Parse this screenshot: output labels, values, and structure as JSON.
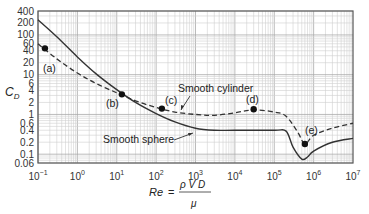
{
  "chart_data": {
    "type": "line",
    "title": "",
    "xlabel": "Re = ρVD/μ",
    "ylabel": "C_D",
    "xscale": "log",
    "yscale": "log",
    "xlim": [
      0.1,
      10000000
    ],
    "ylim": [
      0.06,
      400
    ],
    "grid": true,
    "x_ticks": [
      {
        "base": "10",
        "exp": "−1"
      },
      {
        "base": "10",
        "exp": "0"
      },
      {
        "base": "10",
        "exp": "1"
      },
      {
        "base": "10",
        "exp": "2"
      },
      {
        "base": "10",
        "exp": "3"
      },
      {
        "base": "10",
        "exp": "4"
      },
      {
        "base": "10",
        "exp": "5"
      },
      {
        "base": "10",
        "exp": "6"
      },
      {
        "base": "10",
        "exp": "7"
      }
    ],
    "y_ticks": [
      "400",
      "200",
      "100",
      "60",
      "40",
      "20",
      "10",
      "6",
      "4",
      "2",
      "1",
      "0.6",
      "0.4",
      "0.2",
      "0.1",
      "0.06"
    ],
    "y_tick_values": [
      400,
      200,
      100,
      60,
      40,
      20,
      10,
      6,
      4,
      2,
      1,
      0.6,
      0.4,
      0.2,
      0.1,
      0.06
    ],
    "series": [
      {
        "name": "Smooth sphere",
        "style": "solid",
        "points": [
          [
            0.1,
            240
          ],
          [
            0.3,
            90
          ],
          [
            1,
            28
          ],
          [
            3,
            10.5
          ],
          [
            10,
            4.2
          ],
          [
            30,
            2.0
          ],
          [
            100,
            1.05
          ],
          [
            300,
            0.65
          ],
          [
            1000,
            0.45
          ],
          [
            3000,
            0.4
          ],
          [
            10000,
            0.4
          ],
          [
            100000,
            0.4
          ],
          [
            200000,
            0.38
          ],
          [
            300000,
            0.15
          ],
          [
            500000,
            0.075
          ],
          [
            700000,
            0.085
          ],
          [
            1000000,
            0.12
          ],
          [
            3000000,
            0.2
          ],
          [
            10000000,
            0.25
          ]
        ]
      },
      {
        "name": "Smooth cylinder",
        "style": "dashed",
        "points": [
          [
            0.1,
            60
          ],
          [
            0.3,
            25
          ],
          [
            1,
            11
          ],
          [
            3,
            6
          ],
          [
            10,
            3.5
          ],
          [
            30,
            2.2
          ],
          [
            100,
            1.5
          ],
          [
            300,
            1.15
          ],
          [
            1000,
            1.0
          ],
          [
            3000,
            0.95
          ],
          [
            10000,
            1.1
          ],
          [
            30000,
            1.3
          ],
          [
            100000,
            1.15
          ],
          [
            200000,
            0.9
          ],
          [
            400000,
            0.35
          ],
          [
            600000,
            0.18
          ],
          [
            1000000,
            0.3
          ],
          [
            3000000,
            0.45
          ],
          [
            10000000,
            0.6
          ]
        ]
      }
    ],
    "annotations": [
      {
        "label": "(a)",
        "Re": 0.15,
        "Cd": 46
      },
      {
        "label": "(b)",
        "Re": 13.5,
        "Cd": 3.2
      },
      {
        "label": "(c)",
        "Re": 140,
        "Cd": 1.4
      },
      {
        "label": "(d)",
        "Re": 30000,
        "Cd": 1.35
      },
      {
        "label": "(e)",
        "Re": 600000,
        "Cd": 0.18
      }
    ],
    "curve_labels": [
      {
        "text": "Smooth cylinder",
        "points_to": "cylinder near Re=300"
      },
      {
        "text": "Smooth sphere",
        "points_to": "sphere near Re=1000"
      }
    ]
  },
  "labels": {
    "ylabel_main": "C",
    "ylabel_sub": "D",
    "xlabel_lhs": "Re",
    "xlabel_eq": "=",
    "xlabel_num": "ρ V D",
    "xlabel_den": "μ",
    "cylinder": "Smooth cylinder",
    "sphere": "Smooth sphere",
    "a": "(a)",
    "b": "(b)",
    "c": "(c)",
    "d": "(d)",
    "e": "(e)"
  }
}
